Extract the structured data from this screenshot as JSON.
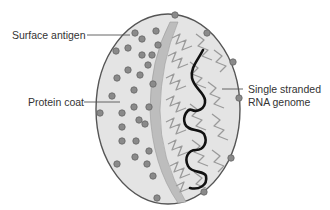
{
  "diagram": {
    "labels": {
      "surface_antigen": "Surface antigen",
      "protein_coat": "Protein coat",
      "rna_line1": "Single stranded",
      "rna_line2": "RNA genome"
    },
    "colors": {
      "capsid_fill": "#e4e4e4",
      "capsid_outline": "#555555",
      "inner_band": "#bdbdbd",
      "antigen_dot": "#8a8a8a",
      "antigen_dot_outline": "#666666",
      "protein_zigzag": "#9a9a9a",
      "rna_strand": "#111111",
      "leader_line": "#555555",
      "text": "#333333"
    }
  }
}
